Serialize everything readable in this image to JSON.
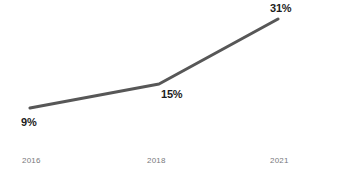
{
  "chart_data": {
    "type": "line",
    "title": "",
    "subtitle": "",
    "xlabel": "",
    "ylabel": "",
    "categories": [
      "2016",
      "2018",
      "2021"
    ],
    "x": [
      2016,
      2018,
      2021
    ],
    "values": [
      9,
      15,
      31
    ],
    "point_labels": [
      "9%",
      "15%",
      "31%"
    ],
    "series": [
      {
        "name": "",
        "values": [
          9,
          15,
          31
        ],
        "color": "#575757",
        "line_width": 3,
        "markers": false
      }
    ],
    "ylim": [
      0,
      36
    ],
    "xlim": [
      2015.4,
      2021.6
    ],
    "grid": false,
    "legend": false,
    "legend_position": "none",
    "axis": {
      "x_axis_visible": true,
      "x_axis_color": "#c9cbcd",
      "y_axis_visible": false,
      "tick_labels": [
        "2016",
        "2018",
        "2021"
      ],
      "tick_label_color": "#77797c"
    },
    "annotations": []
  },
  "geometry": {
    "points": [
      {
        "x": 30,
        "y": 108
      },
      {
        "x": 159,
        "y": 84
      },
      {
        "x": 278,
        "y": 19
      }
    ],
    "axis_line": {
      "x1": 0,
      "x2": 332,
      "y": 153
    }
  },
  "colors": {
    "background": "#ffffff",
    "line": "#575757",
    "label_text": "#1c1c1c",
    "tick_text": "#77797c",
    "axis": "#c9cbcd"
  }
}
